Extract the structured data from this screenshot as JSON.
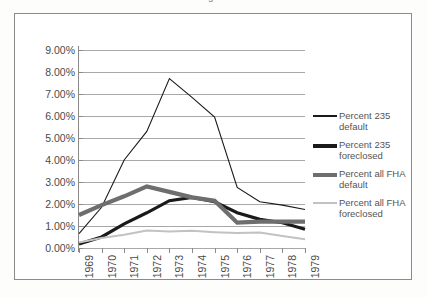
{
  "document": {
    "title_fragment": "Figure"
  },
  "chart_data": {
    "type": "line",
    "title": "",
    "xlabel": "",
    "ylabel": "",
    "categories": [
      "1969",
      "1970",
      "1971",
      "1972",
      "1973",
      "1974",
      "1975",
      "1976",
      "1977",
      "1978",
      "1979"
    ],
    "ytick_labels": [
      "9.00%",
      "8.00%",
      "7.00%",
      "6.00%",
      "5.00%",
      "4.00%",
      "3.00%",
      "2.00%",
      "1.00%",
      "0.00%"
    ],
    "ytick_values": [
      9,
      8,
      7,
      6,
      5,
      4,
      3,
      2,
      1,
      0
    ],
    "ylim": [
      0,
      9
    ],
    "grid": true,
    "legend_position": "right",
    "series": [
      {
        "name": "Percent 235 default",
        "color": "#1a1a1a",
        "width": 1.1,
        "values": [
          0.65,
          1.85,
          4.0,
          5.3,
          7.7,
          6.85,
          5.95,
          2.75,
          2.1,
          1.95,
          1.75
        ]
      },
      {
        "name": "Percent 235 foreclosed",
        "color": "#1a1a1a",
        "width": 3.2,
        "values": [
          0.18,
          0.5,
          1.1,
          1.6,
          2.15,
          2.3,
          2.1,
          1.6,
          1.3,
          1.15,
          0.85
        ]
      },
      {
        "name": "Percent all FHA default",
        "color": "#6e6e6e",
        "width": 4.2,
        "values": [
          1.5,
          1.95,
          2.35,
          2.8,
          2.55,
          2.3,
          2.15,
          1.15,
          1.2,
          1.2,
          1.2
        ]
      },
      {
        "name": "Percent all FHA foreclosed",
        "color": "#c2c2c2",
        "width": 2.0,
        "values": [
          0.25,
          0.45,
          0.6,
          0.8,
          0.75,
          0.78,
          0.72,
          0.68,
          0.7,
          0.55,
          0.4
        ]
      }
    ]
  },
  "legend": {
    "items": [
      {
        "label": "Percent 235 default",
        "swatch": "thin-black-line-icon"
      },
      {
        "label": "Percent 235 foreclosed",
        "swatch": "thick-black-line-icon"
      },
      {
        "label": "Percent all FHA default",
        "swatch": "thick-gray-line-icon"
      },
      {
        "label": "Percent all FHA foreclosed",
        "swatch": "thin-light-gray-line-icon"
      }
    ]
  }
}
